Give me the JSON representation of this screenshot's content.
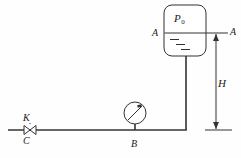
{
  "figure": {
    "background_color": "#fefefe",
    "line_color": "#333333",
    "labels": {
      "tank_pressure": "P",
      "tank_pressure_sub": "0",
      "level_left": "A",
      "level_right": "A",
      "height": "H",
      "valve": "K",
      "valve_outlet": "C",
      "gauge_point": "B"
    },
    "icons": {
      "valve": "bowtie-valve-icon",
      "gauge": "pressure-gauge-icon",
      "arrow_up": "arrow-up-icon",
      "arrow_down": "arrow-down-icon"
    },
    "geometry": {
      "tank": {
        "x": 164,
        "y": 5,
        "width": 42,
        "height": 51,
        "corner_radius": 8
      },
      "liquid_surface_y": 33,
      "downpipe_x": 186,
      "downpipe_top_y": 56,
      "downpipe_bottom_y": 130,
      "horizontal_pipe_y": 130,
      "horizontal_pipe_x_start": 8,
      "horizontal_pipe_x_end": 186,
      "valve_x": 30,
      "gauge_center": {
        "x": 135,
        "y": 113
      },
      "gauge_radius": 11,
      "gauge_stem_top_y": 124,
      "dimension_line_x": 216,
      "dimension_top_y": 33,
      "dimension_bottom_y": 130,
      "liquid_marks": [
        {
          "x1": 170,
          "y": 39,
          "x2": 180
        },
        {
          "x1": 176,
          "y": 44,
          "x2": 186
        },
        {
          "x1": 182,
          "y": 49,
          "x2": 192
        }
      ]
    }
  }
}
